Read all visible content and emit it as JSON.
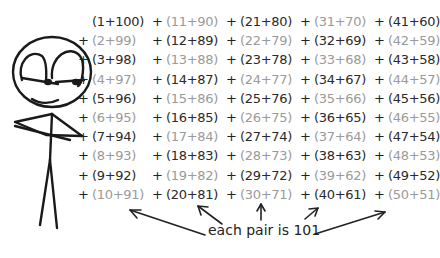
{
  "comic": {
    "caption": "each pair is 101",
    "colors": {
      "dark": "#2a2a2a",
      "light": "#9a9a9a",
      "ink": "#222222"
    },
    "operator": "+",
    "rows": [
      [
        {
          "text": "(1+100)",
          "shade": "dark"
        },
        {
          "text": "(11+90)",
          "shade": "light"
        },
        {
          "text": "(21+80)",
          "shade": "dark"
        },
        {
          "text": "(31+70)",
          "shade": "light"
        },
        {
          "text": "(41+60)",
          "shade": "dark"
        }
      ],
      [
        {
          "text": "(2+99)",
          "shade": "light"
        },
        {
          "text": "(12+89)",
          "shade": "dark"
        },
        {
          "text": "(22+79)",
          "shade": "light"
        },
        {
          "text": "(32+69)",
          "shade": "dark"
        },
        {
          "text": "(42+59)",
          "shade": "light"
        }
      ],
      [
        {
          "text": "(3+98)",
          "shade": "dark"
        },
        {
          "text": "(13+88)",
          "shade": "light"
        },
        {
          "text": "(23+78)",
          "shade": "dark"
        },
        {
          "text": "(33+68)",
          "shade": "light"
        },
        {
          "text": "(43+58)",
          "shade": "dark"
        }
      ],
      [
        {
          "text": "(4+97)",
          "shade": "light"
        },
        {
          "text": "(14+87)",
          "shade": "dark"
        },
        {
          "text": "(24+77)",
          "shade": "light"
        },
        {
          "text": "(34+67)",
          "shade": "dark"
        },
        {
          "text": "(44+57)",
          "shade": "light"
        }
      ],
      [
        {
          "text": "(5+96)",
          "shade": "dark"
        },
        {
          "text": "(15+86)",
          "shade": "light"
        },
        {
          "text": "(25+76)",
          "shade": "dark"
        },
        {
          "text": "(35+66)",
          "shade": "light"
        },
        {
          "text": "(45+56)",
          "shade": "dark"
        }
      ],
      [
        {
          "text": "(6+95)",
          "shade": "light"
        },
        {
          "text": "(16+85)",
          "shade": "dark"
        },
        {
          "text": "(26+75)",
          "shade": "light"
        },
        {
          "text": "(36+65)",
          "shade": "dark"
        },
        {
          "text": "(46+55)",
          "shade": "light"
        }
      ],
      [
        {
          "text": "(7+94)",
          "shade": "dark"
        },
        {
          "text": "(17+84)",
          "shade": "light"
        },
        {
          "text": "(27+74)",
          "shade": "dark"
        },
        {
          "text": "(37+64)",
          "shade": "light"
        },
        {
          "text": "(47+54)",
          "shade": "dark"
        }
      ],
      [
        {
          "text": "(8+93)",
          "shade": "light"
        },
        {
          "text": "(18+83)",
          "shade": "dark"
        },
        {
          "text": "(28+73)",
          "shade": "light"
        },
        {
          "text": "(38+63)",
          "shade": "dark"
        },
        {
          "text": "(48+53)",
          "shade": "light"
        }
      ],
      [
        {
          "text": "(9+92)",
          "shade": "dark"
        },
        {
          "text": "(19+82)",
          "shade": "light"
        },
        {
          "text": "(29+72)",
          "shade": "dark"
        },
        {
          "text": "(39+62)",
          "shade": "light"
        },
        {
          "text": "(49+52)",
          "shade": "dark"
        }
      ],
      [
        {
          "text": "(10+91)",
          "shade": "light"
        },
        {
          "text": "(20+81)",
          "shade": "dark"
        },
        {
          "text": "(30+71)",
          "shade": "light"
        },
        {
          "text": "(40+61)",
          "shade": "dark"
        },
        {
          "text": "(50+51)",
          "shade": "light"
        }
      ]
    ]
  }
}
